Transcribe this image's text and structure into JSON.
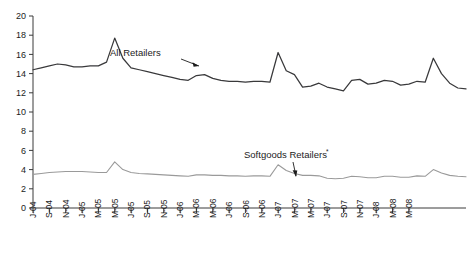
{
  "chart_data": {
    "type": "line",
    "title": "",
    "subtitle": "",
    "xlabel": "",
    "ylabel": "",
    "ylim": [
      0,
      20
    ],
    "ytick_step": 2,
    "yticks": [
      0,
      2,
      4,
      6,
      8,
      10,
      12,
      14,
      16,
      18,
      20
    ],
    "ytick_labels": [
      "0",
      "2",
      "4",
      "6",
      "8",
      "10",
      "12",
      "14",
      "16",
      "18",
      "20"
    ],
    "grid": false,
    "legend_position": "inline-annotation",
    "xtick_labels": [
      "J-04",
      "S-04",
      "N-04",
      "J-05",
      "M-05",
      "M-05",
      "J-05",
      "S-05",
      "N-05",
      "J-06",
      "M-06",
      "M-06",
      "J-06",
      "S-06",
      "N-06",
      "J-07",
      "M-07",
      "M-07",
      "J-07",
      "S-07",
      "N-07",
      "J-08",
      "M-08",
      "M-08"
    ],
    "xtick_every_n_points": 2,
    "x": [
      "J-04",
      "F-04",
      "M-04",
      "A-04",
      "M-04",
      "J-04",
      "J-04",
      "A-04",
      "S-04",
      "O-04",
      "N-04",
      "D-04",
      "J-05",
      "F-05",
      "M-05",
      "A-05",
      "M-05",
      "J-05",
      "J-05",
      "A-05",
      "S-05",
      "O-05",
      "N-05",
      "D-05",
      "J-06",
      "F-06",
      "M-06",
      "A-06",
      "M-06",
      "J-06",
      "J-06",
      "A-06",
      "S-06",
      "O-06",
      "N-06",
      "D-06",
      "J-07",
      "F-07",
      "M-07",
      "A-07",
      "M-07",
      "J-07",
      "J-07",
      "A-07",
      "S-07",
      "O-07",
      "N-07",
      "D-07",
      "J-08",
      "F-08",
      "M-08",
      "A-08",
      "M-08",
      "J-08"
    ],
    "series": [
      {
        "name": "All Retailers",
        "color": "#39393b",
        "values": [
          14.4,
          14.6,
          14.8,
          15.0,
          14.9,
          14.7,
          14.7,
          14.8,
          14.8,
          15.2,
          17.7,
          15.6,
          14.6,
          14.4,
          14.2,
          14.0,
          13.8,
          13.6,
          13.4,
          13.3,
          13.8,
          13.9,
          13.5,
          13.3,
          13.2,
          13.2,
          13.1,
          13.2,
          13.2,
          13.1,
          16.2,
          14.3,
          13.9,
          12.6,
          12.7,
          13.0,
          12.6,
          12.4,
          12.2,
          13.3,
          13.4,
          12.9,
          13.0,
          13.3,
          13.2,
          12.8,
          12.9,
          13.2,
          13.1,
          15.6,
          14.0,
          13.0,
          12.5,
          12.4
        ]
      },
      {
        "name": "Softgoods Retailers*",
        "color": "#9a9a9a",
        "values": [
          3.5,
          3.6,
          3.7,
          3.75,
          3.8,
          3.8,
          3.8,
          3.75,
          3.7,
          3.7,
          4.8,
          4.0,
          3.7,
          3.6,
          3.55,
          3.5,
          3.45,
          3.4,
          3.35,
          3.3,
          3.45,
          3.45,
          3.4,
          3.4,
          3.35,
          3.35,
          3.3,
          3.35,
          3.35,
          3.3,
          4.5,
          3.9,
          3.6,
          3.4,
          3.4,
          3.35,
          3.1,
          3.05,
          3.1,
          3.3,
          3.25,
          3.15,
          3.15,
          3.3,
          3.3,
          3.2,
          3.2,
          3.35,
          3.3,
          4.0,
          3.65,
          3.4,
          3.3,
          3.25
        ]
      }
    ],
    "annotations": [
      {
        "text": "All Retailers",
        "name": "annotation-all-retailers",
        "superscript": ""
      },
      {
        "text": "Softgoods Retailers",
        "name": "annotation-softgoods-retailers",
        "superscript": "*"
      }
    ]
  }
}
